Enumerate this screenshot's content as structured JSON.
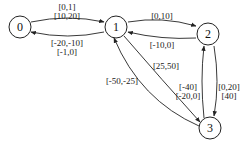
{
  "diagram": {
    "type": "directed-graph",
    "nodes": [
      {
        "id": "0",
        "label": "0"
      },
      {
        "id": "1",
        "label": "1"
      },
      {
        "id": "2",
        "label": "2"
      },
      {
        "id": "3",
        "label": "3"
      }
    ],
    "edges": [
      {
        "from": "0",
        "to": "1",
        "labels": [
          "[0,1]",
          "[10,20]"
        ]
      },
      {
        "from": "1",
        "to": "0",
        "labels": [
          "[-20,-10]",
          "[-1,0]"
        ]
      },
      {
        "from": "1",
        "to": "2",
        "labels": [
          "[0,10]"
        ]
      },
      {
        "from": "2",
        "to": "1",
        "labels": [
          "[-10,0]"
        ]
      },
      {
        "from": "1",
        "to": "3",
        "labels": [
          "[25,50]"
        ]
      },
      {
        "from": "3",
        "to": "1",
        "labels": [
          "[-50,-25]"
        ]
      },
      {
        "from": "3",
        "to": "2",
        "labels": [
          "[-40]",
          "[-20,0]"
        ]
      },
      {
        "from": "2",
        "to": "3",
        "labels": [
          "[0,20]",
          "[40]"
        ]
      }
    ]
  }
}
